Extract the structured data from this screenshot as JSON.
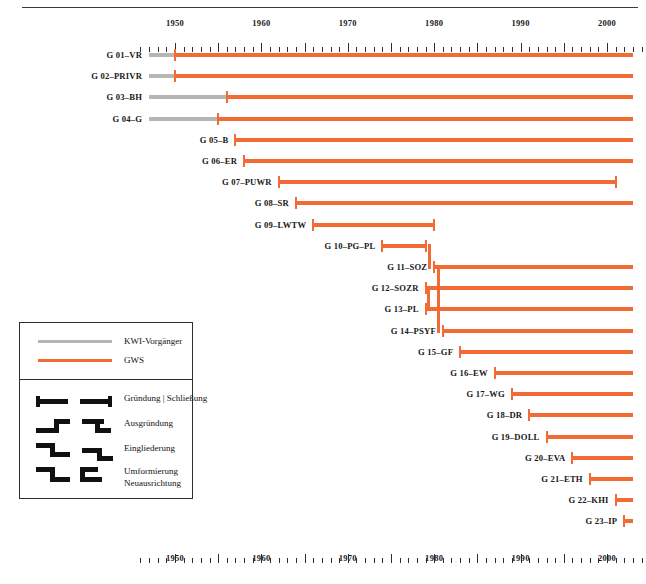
{
  "chart_data": {
    "type": "timeline",
    "title": "",
    "xlabel": "",
    "ylabel": "",
    "xlim": [
      1946,
      2004
    ],
    "axis_years": [
      1950,
      1960,
      1970,
      1980,
      1990,
      2000
    ],
    "tick_interval": 1,
    "major_tick_interval": 5,
    "grid": false,
    "legend_position": "left-lower",
    "categories": [
      "G 01–VR",
      "G 02–PRIVR",
      "G 03–BH",
      "G 04–G",
      "G 05–B",
      "G 06–ER",
      "G 07–PUWR",
      "G 08–SR",
      "G 09–LWTW",
      "G 10–PG–PL",
      "G 11–SOZ",
      "G 12–SOZR",
      "G 13–PL",
      "G 14–PSYF",
      "G 15–GF",
      "G 16–EW",
      "G 17–WG",
      "G 18–DR",
      "G 19–DOLL",
      "G 20–EVA",
      "G 21–ETH",
      "G 22–KHI",
      "G 23–IP"
    ],
    "series": [
      {
        "name": "KWI-Vorgänger",
        "color": "#b6b6b6"
      },
      {
        "name": "GWS",
        "color": "#f26b35"
      }
    ],
    "rows": [
      {
        "label": "G 01–VR",
        "predecessor_start": 1947,
        "start": 1950,
        "end": 2003,
        "end_open": true
      },
      {
        "label": "G 02–PRIVR",
        "predecessor_start": 1947,
        "start": 1950,
        "end": 2003,
        "end_open": true
      },
      {
        "label": "G 03–BH",
        "predecessor_start": 1947,
        "start": 1956,
        "end": 2003,
        "end_open": true
      },
      {
        "label": "G 04–G",
        "predecessor_start": 1947,
        "start": 1955,
        "end": 2003,
        "end_open": true
      },
      {
        "label": "G 05–B",
        "start": 1957,
        "end": 2003,
        "end_open": true
      },
      {
        "label": "G 06–ER",
        "start": 1958,
        "end": 2003,
        "end_open": true
      },
      {
        "label": "G 07–PUWR",
        "start": 1962,
        "end": 2001,
        "end_open": false
      },
      {
        "label": "G 08–SR",
        "start": 1964,
        "end": 2003,
        "end_open": true
      },
      {
        "label": "G 09–LWTW",
        "start": 1966,
        "end": 1980,
        "end_open": false
      },
      {
        "label": "G 10–PG–PL",
        "start": 1974,
        "end": 1979,
        "end_open": false,
        "branch": "ausgruendung-down"
      },
      {
        "label": "G 11–SOZ",
        "start": 1980,
        "end": 2003,
        "end_open": true
      },
      {
        "label": "G 12–SOZR",
        "start": 1979,
        "end": 2003,
        "end_open": true
      },
      {
        "label": "G 13–PL",
        "start": 1979,
        "end": 2003,
        "end_open": true
      },
      {
        "label": "G 14–PSYF",
        "start": 1981,
        "end": 2003,
        "end_open": true
      },
      {
        "label": "G 15–GF",
        "start": 1983,
        "end": 2003,
        "end_open": true
      },
      {
        "label": "G 16–EW",
        "start": 1987,
        "end": 2003,
        "end_open": true
      },
      {
        "label": "G 17–WG",
        "start": 1989,
        "end": 2003,
        "end_open": true
      },
      {
        "label": "G 18–DR",
        "start": 1991,
        "end": 2003,
        "end_open": true
      },
      {
        "label": "G 19–DOLL",
        "start": 1993,
        "end": 2003,
        "end_open": true
      },
      {
        "label": "G 20–EVA",
        "start": 1996,
        "end": 2003,
        "end_open": true
      },
      {
        "label": "G 21–ETH",
        "start": 1998,
        "end": 2003,
        "end_open": true
      },
      {
        "label": "G 22–KHI",
        "start": 2001,
        "end": 2003,
        "end_open": true
      },
      {
        "label": "G 23–IP",
        "start": 2002,
        "end": 2003,
        "end_open": true
      }
    ]
  },
  "legend": {
    "lines": [
      {
        "key": "kwi",
        "label": "KWI-Vorgänger",
        "color": "#b6b6b6"
      },
      {
        "key": "gws",
        "label": "GWS",
        "color": "#f26b35"
      }
    ],
    "symbols": [
      {
        "key": "gruendung-schliessung",
        "label": "Gründung | Schließung"
      },
      {
        "key": "ausgruendung",
        "label": "Ausgründung"
      },
      {
        "key": "eingliederung",
        "label": "Eingliederung"
      },
      {
        "key": "umformierung",
        "label": "Umformierung",
        "label2": "Neuausrichtung"
      }
    ]
  }
}
